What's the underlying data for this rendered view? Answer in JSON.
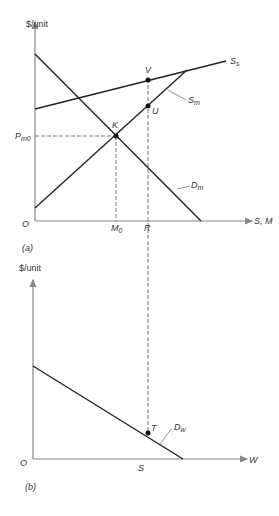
{
  "panel_a": {
    "y_axis_label": "$/unit",
    "x_axis_label": "S, M",
    "origin_label": "O",
    "caption": "(a)",
    "price_label": "P",
    "price_sub": "m0",
    "m0_label": "M",
    "m0_sub": "0",
    "r_label": "R",
    "curves": {
      "ss_label": "S",
      "ss_sub": "s",
      "sm_label": "S",
      "sm_sub": "m",
      "dm_label": "D",
      "dm_sub": "m"
    },
    "points": {
      "k": "K",
      "v": "V",
      "u": "U"
    }
  },
  "panel_b": {
    "y_axis_label": "$/unit",
    "x_axis_label": "W",
    "origin_label": "O",
    "caption": "(b)",
    "s_label": "S",
    "curves": {
      "dw_label": "D",
      "dw_sub": "w"
    },
    "points": {
      "t": "T"
    }
  },
  "colors": {
    "axis": "#888888",
    "curve": "#222222",
    "dashed": "#555555"
  }
}
